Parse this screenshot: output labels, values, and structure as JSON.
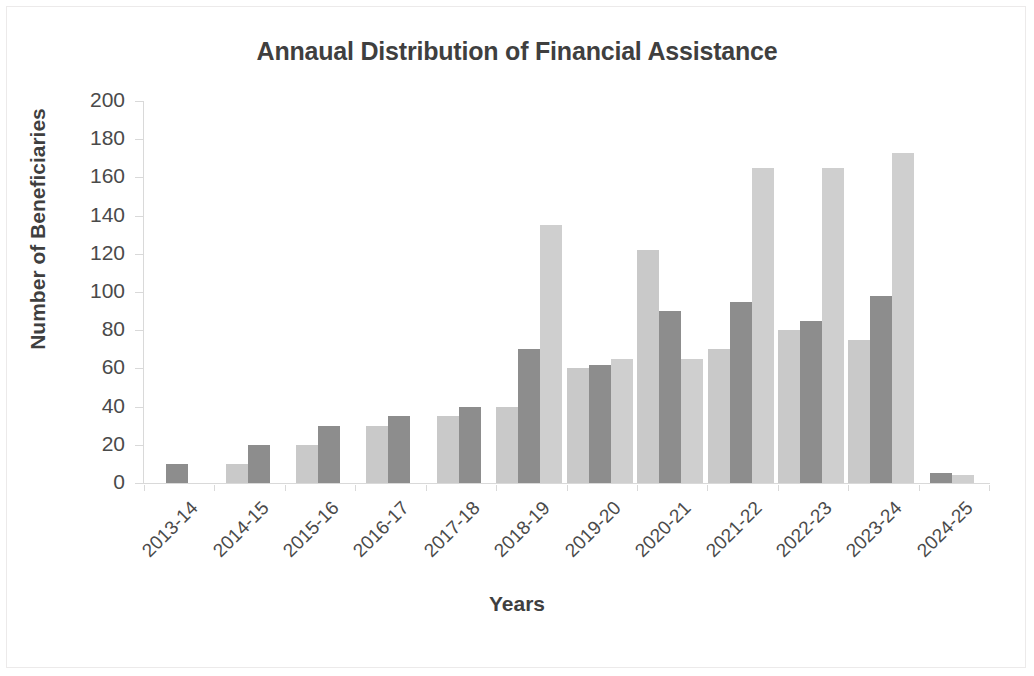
{
  "chart_data": {
    "type": "bar",
    "title": "Annaual Distribution of Financial Assistance",
    "xlabel": "Years",
    "ylabel": "Number of Beneficiaries",
    "ylim": [
      0,
      200
    ],
    "ytick_step": 20,
    "yticks": [
      "200",
      "180",
      "160",
      "140",
      "120",
      "100",
      "80",
      "60",
      "40",
      "20",
      "0"
    ],
    "grid": false,
    "legend": "none",
    "categories": [
      "2013-14",
      "2014-15",
      "2015-16",
      "2016-17",
      "2017-18",
      "2018-19",
      "2019-20",
      "2020-21",
      "2021-22",
      "2022-23",
      "2023-24",
      "2024-25"
    ],
    "series": [
      {
        "name": "Series 1",
        "color": "#c9c9c9",
        "values": [
          0,
          10,
          20,
          30,
          35,
          40,
          60,
          122,
          70,
          80,
          75,
          0
        ]
      },
      {
        "name": "Series 2",
        "color": "#8d8d8d",
        "values": [
          10,
          20,
          30,
          35,
          40,
          70,
          62,
          90,
          95,
          85,
          98,
          5
        ]
      },
      {
        "name": "Series 3",
        "color": "#cfcfcf",
        "values": [
          0,
          0,
          0,
          0,
          0,
          135,
          65,
          65,
          165,
          165,
          173,
          4
        ]
      }
    ],
    "colors": {
      "light": "#c9c9c9",
      "dark": "#8d8d8d",
      "light2": "#cfcfcf",
      "axis": "#d9d9d9",
      "text": "#3f3f3f",
      "tick_text": "#4a4a4a",
      "frame": "#eceaea",
      "background": "#ffffff"
    }
  }
}
